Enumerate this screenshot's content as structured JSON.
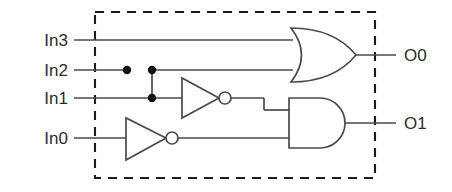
{
  "diagram": {
    "boundary": {
      "name": "module-boundary",
      "style": "dashed",
      "x": 95,
      "y": 12,
      "width": 280,
      "height": 166,
      "color": "#1a1a1a"
    },
    "colors": {
      "wire": "#4a4a4a",
      "gate_outline": "#4a4a4a",
      "gate_fill": "#ffffff",
      "junction": "#111111",
      "text": "#2b2b2b",
      "background": "#ffffff"
    },
    "inputs": [
      {
        "label": "In3",
        "y": 40,
        "label_x": 68,
        "wire_from": 74,
        "wire_to": 293
      },
      {
        "label": "In2",
        "y": 70,
        "label_x": 68,
        "wire_from": 74,
        "wire_to": 127
      },
      {
        "label": "In1",
        "y": 98,
        "label_x": 68,
        "wire_from": 74,
        "wire_to": 180
      },
      {
        "label": "In0",
        "y": 138,
        "label_x": 68,
        "wire_from": 74,
        "wire_to": 124
      }
    ],
    "outputs": [
      {
        "label": "O0",
        "y": 55,
        "label_x": 404,
        "wire_from": 355,
        "wire_to": 396
      },
      {
        "label": "O1",
        "y": 123,
        "label_x": 404,
        "wire_from": 350,
        "wire_to": 396
      }
    ],
    "gates": [
      {
        "type": "or",
        "name": "or-gate",
        "x": 290,
        "y": 28,
        "width": 66,
        "height": 54,
        "inputs": [
          "In3",
          "In2"
        ],
        "output": "O0"
      },
      {
        "type": "and",
        "name": "and-gate",
        "x": 288,
        "y": 98,
        "width": 62,
        "height": 50,
        "inputs": [
          "inverter-upper",
          "inverter-lower"
        ],
        "output": "O1"
      },
      {
        "type": "inverter",
        "name": "inverter-upper",
        "x": 180,
        "y": 78,
        "width": 40,
        "height": 40,
        "bubble_cx": 225,
        "bubble_r": 6,
        "input": "In1",
        "output": "and-gate"
      },
      {
        "type": "inverter",
        "name": "inverter-lower",
        "x": 124,
        "y": 118,
        "width": 42,
        "height": 42,
        "bubble_cx": 172,
        "bubble_r": 6,
        "input": "In0",
        "output": "and-gate"
      }
    ],
    "junctions": [
      {
        "name": "in2-terminal-dot",
        "x": 127,
        "y": 70,
        "r": 4.2
      },
      {
        "name": "in2-branch-dot",
        "x": 152,
        "y": 70,
        "r": 4.2
      },
      {
        "name": "in1-branch-dot",
        "x": 152,
        "y": 98,
        "r": 4.2
      }
    ]
  }
}
